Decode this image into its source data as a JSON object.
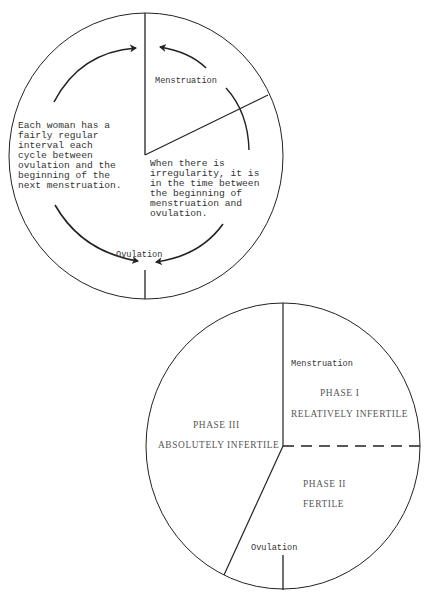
{
  "diagram_top": {
    "title": "Menstrual cycle timing",
    "labels": {
      "menstruation": "Menstruation",
      "ovulation": "Ovulation"
    },
    "left_note": [
      "Each woman has a",
      "fairly regular",
      "interval each",
      "cycle between",
      "ovulation and the",
      "beginning of the",
      "next menstruation."
    ],
    "right_note": [
      "When there is",
      "irregularity, it is",
      "in the time between",
      "the beginning of",
      "menstruation and",
      "ovulation."
    ]
  },
  "diagram_bottom": {
    "title": "Phases of the cycle",
    "labels": {
      "menstruation": "Menstruation",
      "ovulation": "Ovulation"
    },
    "phases": [
      {
        "name": "PHASE I",
        "description": "RELATIVELY INFERTILE"
      },
      {
        "name": "PHASE II",
        "description": "FERTILE"
      },
      {
        "name": "PHASE III",
        "description": "ABSOLUTELY INFERTILE"
      }
    ]
  }
}
